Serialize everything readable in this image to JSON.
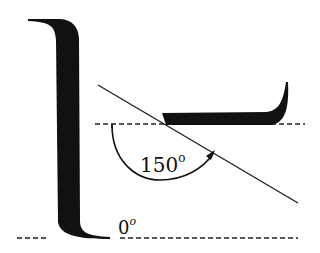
{
  "diagram": {
    "type": "contact-angle-illustration",
    "colors": {
      "ink": "#111111",
      "background": "#ffffff"
    },
    "labels": {
      "large_angle": {
        "value": "150",
        "unit_superscript": "o"
      },
      "zero_angle": {
        "value": "0",
        "unit_superscript": "o"
      }
    },
    "shapes": {
      "vertical_wetting_profile": "fully-wetting liquid film on wall, 0° contact angle",
      "tilted_drop_profile": "non-wetting liquid drop profile, 150° contact angle",
      "tangent_line": "tangent at contact point",
      "baseline_upper": "dashed reference line",
      "baseline_lower": "dashed reference line",
      "angle_arc": "arc with arrowhead indicating measured angle"
    }
  }
}
